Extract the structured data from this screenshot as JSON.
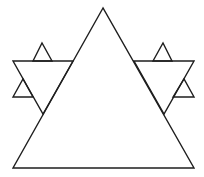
{
  "diagram": {
    "type": "fractal-triangle",
    "background": "#ffffff",
    "stroke_color": "#1e1e1e",
    "stroke_width": 1.4,
    "shapes": [
      {
        "name": "main-triangle",
        "points": "103,8 13,168 194,168"
      },
      {
        "name": "left-inverted-triangle",
        "points": "13,61 73,61 43,114"
      },
      {
        "name": "right-inverted-triangle",
        "points": "134,61 194,61 164,114"
      },
      {
        "name": "left-top-small-triangle",
        "points": "33,61 42,43 52,61"
      },
      {
        "name": "left-side-small-triangle",
        "points": "13,97 23,79 33,97"
      },
      {
        "name": "right-top-small-triangle",
        "points": "153,61 163,43 172,61"
      },
      {
        "name": "right-side-small-triangle",
        "points": "173,97 184,79 194,97"
      }
    ]
  }
}
